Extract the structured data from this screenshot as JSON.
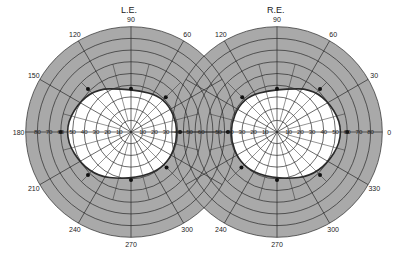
{
  "left_eye": {
    "label": "L.E.",
    "center": [
      131,
      132
    ],
    "meridian_labels": [
      {
        "deg": 90,
        "text": "90"
      },
      {
        "deg": 60,
        "text": "60"
      },
      {
        "deg": 120,
        "text": "120"
      },
      {
        "deg": 150,
        "text": "150"
      },
      {
        "deg": 180,
        "text": "180"
      },
      {
        "deg": 210,
        "text": "210"
      },
      {
        "deg": 240,
        "text": "240"
      },
      {
        "deg": 270,
        "text": "270"
      },
      {
        "deg": 300,
        "text": "300"
      }
    ],
    "scale_ticks": [
      "80",
      "70",
      "60",
      "50",
      "40",
      "30",
      "20",
      "10",
      "10",
      "20",
      "30",
      "40",
      "50",
      "60"
    ],
    "isopter_points_deg": [
      {
        "meridian": 0,
        "ecc": 42
      },
      {
        "meridian": 45,
        "ecc": 42
      },
      {
        "meridian": 90,
        "ecc": 37
      },
      {
        "meridian": 135,
        "ecc": 52
      },
      {
        "meridian": 180,
        "ecc": 60
      },
      {
        "meridian": 225,
        "ecc": 52
      },
      {
        "meridian": 270,
        "ecc": 41
      },
      {
        "meridian": 315,
        "ecc": 43
      }
    ]
  },
  "right_eye": {
    "label": "R.E.",
    "center": [
      277,
      132
    ],
    "meridian_labels": [
      {
        "deg": 90,
        "text": "90"
      },
      {
        "deg": 60,
        "text": "60"
      },
      {
        "deg": 120,
        "text": "120"
      },
      {
        "deg": 30,
        "text": "30"
      },
      {
        "deg": 0,
        "text": "0"
      },
      {
        "deg": 330,
        "text": "330"
      },
      {
        "deg": 240,
        "text": "240"
      },
      {
        "deg": 270,
        "text": "270"
      },
      {
        "deg": 300,
        "text": "300"
      }
    ],
    "scale_ticks": [
      "50",
      "40",
      "30",
      "20",
      "10",
      "10",
      "20",
      "30",
      "40",
      "50",
      "60",
      "70",
      "80"
    ],
    "isopter_points_deg": [
      {
        "meridian": 0,
        "ecc": 60
      },
      {
        "meridian": 45,
        "ecc": 52
      },
      {
        "meridian": 90,
        "ecc": 37
      },
      {
        "meridian": 135,
        "ecc": 42
      },
      {
        "meridian": 180,
        "ecc": 42
      },
      {
        "meridian": 225,
        "ecc": 43
      },
      {
        "meridian": 270,
        "ecc": 41
      },
      {
        "meridian": 315,
        "ecc": 52
      }
    ]
  },
  "rings_deg": [
    10,
    20,
    30,
    40,
    50,
    60,
    70,
    80,
    90
  ],
  "colors": {
    "shade": "#a9a9a9",
    "field": "#ffffff",
    "line": "#2a2a2a"
  }
}
